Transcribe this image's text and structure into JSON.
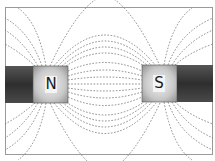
{
  "diagram": {
    "poles": [
      {
        "id": "north",
        "label": "N"
      },
      {
        "id": "south",
        "label": "S"
      }
    ],
    "colors": {
      "frame": "#9a9a9a",
      "bar_dark": "#3a3a3a",
      "pole_light": "#e4e4e4",
      "pole_dark": "#9c9c9c",
      "field_line": "#777777",
      "background": "#ffffff"
    }
  }
}
